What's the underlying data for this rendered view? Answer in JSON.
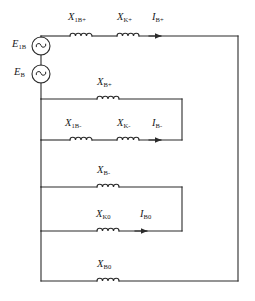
{
  "figure": {
    "kind": "circuit-diagram",
    "title": "",
    "width": 255,
    "height": 301,
    "line_color": "#2b2b2b",
    "text_color": "#1a1a1a",
    "background": "#ffffff"
  },
  "sources": [
    {
      "id": "src-e1b",
      "label_main": "E",
      "label_sub": "1B",
      "symbol": "~",
      "cx": 41,
      "cy": 46,
      "r": 9
    },
    {
      "id": "src-eb",
      "label_main": "E",
      "label_sub": "B",
      "symbol": "~",
      "cx": 41,
      "cy": 74,
      "r": 9
    }
  ],
  "reactances": [
    {
      "id": "x-1b-plus",
      "label_main": "X",
      "label_sub": "1B+",
      "cx": 81,
      "cy": 36,
      "label_x": 68,
      "label_y": 12
    },
    {
      "id": "x-k-plus",
      "label_main": "X",
      "label_sub": "K+",
      "cx": 128,
      "cy": 36,
      "label_x": 117,
      "label_y": 12
    },
    {
      "id": "x-b-plus",
      "label_main": "X",
      "label_sub": "B+",
      "cx": 108,
      "cy": 99,
      "label_x": 97,
      "label_y": 77
    },
    {
      "id": "x-1b-minus",
      "label_main": "X",
      "label_sub": "1B-",
      "cx": 81,
      "cy": 140,
      "label_x": 65,
      "label_y": 118
    },
    {
      "id": "x-k-minus",
      "label_main": "X",
      "label_sub": "K-",
      "cx": 128,
      "cy": 140,
      "label_x": 117,
      "label_y": 118
    },
    {
      "id": "x-b-minus",
      "label_main": "X",
      "label_sub": "B-",
      "cx": 108,
      "cy": 187,
      "label_x": 97,
      "label_y": 165
    },
    {
      "id": "x-k0",
      "label_main": "X",
      "label_sub": "K0",
      "cx": 108,
      "cy": 231,
      "label_x": 96,
      "label_y": 209
    },
    {
      "id": "x-b0",
      "label_main": "X",
      "label_sub": "B0",
      "cx": 108,
      "cy": 281,
      "label_x": 97,
      "label_y": 259
    }
  ],
  "currents": [
    {
      "id": "i-b-plus",
      "label_main": "I",
      "label_sub": "B+",
      "label_x": 160,
      "label_y": 12,
      "arrow_x": 160,
      "arrow_y": 36
    },
    {
      "id": "i-b-minus",
      "label_main": "I",
      "label_sub": "B-",
      "label_x": 160,
      "label_y": 118,
      "arrow_x": 160,
      "arrow_y": 140
    },
    {
      "id": "i-b0",
      "label_main": "I",
      "label_sub": "B0",
      "label_x": 146,
      "label_y": 209,
      "arrow_x": 146,
      "arrow_y": 231
    }
  ],
  "nodes": {
    "left_rail_x": 41,
    "right_rail_x": 238,
    "shunt_right_x": 182,
    "top_y": 36,
    "bottom_y": 281
  }
}
